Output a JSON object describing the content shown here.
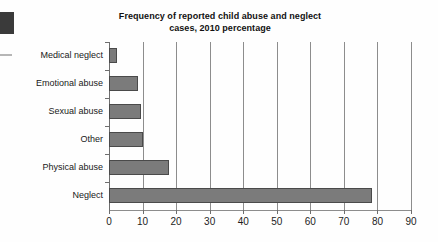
{
  "chart_data": {
    "type": "bar",
    "orientation": "horizontal",
    "title": "Frequency of reported child abuse and neglect cases, 2010 percentage",
    "title_line1": "Frequency of reported child abuse and neglect",
    "title_line2": "cases, 2010 percentage",
    "xlabel": "",
    "ylabel": "",
    "xlim": [
      0,
      90
    ],
    "xticks": [
      0,
      10,
      20,
      30,
      40,
      50,
      60,
      70,
      80,
      90
    ],
    "xtick_labels": [
      "0",
      "10",
      "20",
      "30",
      "40",
      "50",
      "60",
      "70",
      "80",
      "90"
    ],
    "grid": "vertical",
    "legend": "none",
    "bar_color": "#7b7b7b",
    "bar_border_color": "#4a4a4a",
    "axis_color": "#8d8d8d",
    "categories": [
      "Medical neglect",
      "Emotional abuse",
      "Sexual abuse",
      "Other",
      "Physical abuse",
      "Neglect"
    ],
    "values": [
      2.5,
      8.5,
      9.5,
      10,
      18,
      78.5
    ],
    "bars": [
      {
        "label": "Medical neglect",
        "value": 2.5
      },
      {
        "label": "Emotional abuse",
        "value": 8.5
      },
      {
        "label": "Sexual abuse",
        "value": 9.5
      },
      {
        "label": "Other",
        "value": 10
      },
      {
        "label": "Physical abuse",
        "value": 18
      },
      {
        "label": "Neglect",
        "value": 78.5
      }
    ]
  }
}
